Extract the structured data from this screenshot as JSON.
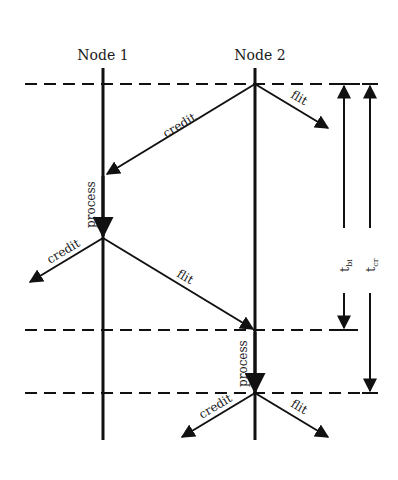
{
  "nodes": [
    {
      "label": "Node 1"
    },
    {
      "label": "Node 2"
    }
  ],
  "arrows": {
    "credit_1": "credit",
    "flit_1": "flit",
    "process_1": "process",
    "credit_2": "credit",
    "flit_2": "flit",
    "process_2": "process",
    "credit_3": "credit",
    "flit_3": "flit"
  },
  "intervals": {
    "tbi": {
      "base": "t",
      "sub": "bi"
    },
    "tcr": {
      "base": "t",
      "sub": "cr"
    }
  },
  "colors": {
    "line": "#111111",
    "background": "#ffffff"
  }
}
